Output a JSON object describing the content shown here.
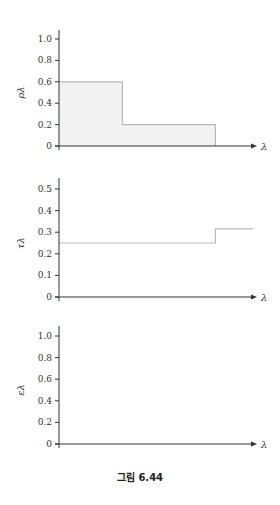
{
  "caption": "그림 6.44",
  "chart_data": [
    {
      "type": "line",
      "id": "reflectivity",
      "title": "",
      "xlabel": "λ",
      "ylabel": "ρλ",
      "ylim": [
        0,
        1.0
      ],
      "yticks": [
        "0",
        "0.2",
        "0.4",
        "0.6",
        "0.8",
        "1.0"
      ],
      "xticks": [],
      "step": true,
      "filled": true,
      "segments": [
        {
          "x_start": 0.0,
          "x_end": 0.32,
          "y": 0.6
        },
        {
          "x_start": 0.32,
          "x_end": 0.79,
          "y": 0.2
        }
      ],
      "grid": false
    },
    {
      "type": "line",
      "id": "transmissivity",
      "title": "",
      "xlabel": "λ",
      "ylabel": "τλ",
      "ylim": [
        0,
        0.5
      ],
      "yticks": [
        "0",
        "0.1",
        "0.2",
        "0.3",
        "0.4",
        "0.5"
      ],
      "xticks": [],
      "step": true,
      "filled": false,
      "segments": [
        {
          "x_start": 0.0,
          "x_end": 0.79,
          "y": 0.25
        },
        {
          "x_start": 0.79,
          "x_end": 0.98,
          "y": 0.315
        }
      ],
      "grid": false
    },
    {
      "type": "line",
      "id": "emissivity",
      "title": "",
      "xlabel": "λ",
      "ylabel": "ελ",
      "ylim": [
        0,
        1.0
      ],
      "yticks": [
        "0",
        "0.2",
        "0.4",
        "0.6",
        "0.8",
        "1.0"
      ],
      "xticks": [],
      "step": false,
      "filled": false,
      "segments": [],
      "grid": false
    }
  ],
  "colors": {
    "axis": "#333333",
    "curve": "#b8b8b8",
    "fill": "#f2f2f2"
  }
}
